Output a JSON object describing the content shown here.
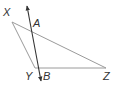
{
  "diagram": {
    "type": "geometry",
    "colors": {
      "triangle_stroke": "#9a9a9a",
      "line_stroke": "#333333",
      "label_color": "#333333",
      "background": "#ffffff"
    },
    "points": {
      "X": {
        "label": "X",
        "x": 12,
        "y": 22
      },
      "Y": {
        "label": "Y",
        "x": 35,
        "y": 68
      },
      "Z": {
        "label": "Z",
        "x": 106,
        "y": 68
      },
      "A": {
        "label": "A",
        "x": 31,
        "y": 29
      },
      "B": {
        "label": "B",
        "x": 38,
        "y": 68
      }
    },
    "segments": [
      {
        "from": "X",
        "to": "Z"
      },
      {
        "from": "X",
        "to": "Y"
      },
      {
        "from": "Y",
        "to": "Z"
      }
    ],
    "line": {
      "through": [
        "A",
        "B"
      ],
      "arrows": "both",
      "start": {
        "x": 27,
        "y": 5
      },
      "end": {
        "x": 41,
        "y": 82
      }
    }
  }
}
